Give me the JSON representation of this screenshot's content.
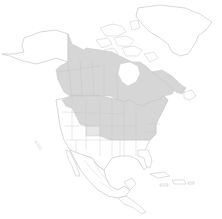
{
  "map": {
    "type": "distribution-range-map",
    "region": "North America",
    "colors": {
      "background": "#ffffff",
      "absent": "#ffffff",
      "present": "#d6d6d6",
      "present_light": "#e6e6e6",
      "border": "#c4c4c4",
      "coast": "#bdbdbd"
    },
    "legend": [],
    "regions_shaded": [
      "Yukon",
      "British Columbia",
      "Northwest Territories (south)",
      "Alberta",
      "Saskatchewan",
      "Manitoba",
      "Nunavut (south)",
      "Ontario",
      "Quebec",
      "New Brunswick",
      "Nova Scotia",
      "Labrador",
      "Washington",
      "Idaho",
      "Montana",
      "Wyoming",
      "North Dakota",
      "South Dakota",
      "Nebraska",
      "Kansas",
      "Minnesota",
      "Iowa",
      "Missouri",
      "Wisconsin",
      "Illinois",
      "Michigan",
      "Indiana",
      "Ohio",
      "Kentucky",
      "Tennessee",
      "Pennsylvania",
      "New York",
      "Vermont",
      "New Hampshire",
      "Maine",
      "Massachusetts",
      "Connecticut",
      "Rhode Island",
      "New Jersey",
      "Delaware",
      "Maryland",
      "West Virginia",
      "Virginia",
      "North Carolina"
    ],
    "regions_light": [
      "Colorado",
      "Oklahoma (part)"
    ],
    "regions_unshaded": [
      "Alaska",
      "Greenland",
      "Arctic Archipelago",
      "Oregon",
      "California",
      "Nevada",
      "Utah",
      "Arizona",
      "New Mexico",
      "Texas",
      "Louisiana",
      "Mississippi",
      "Alabama",
      "Georgia",
      "Florida",
      "South Carolina",
      "Mexico",
      "Central America",
      "Caribbean"
    ]
  }
}
